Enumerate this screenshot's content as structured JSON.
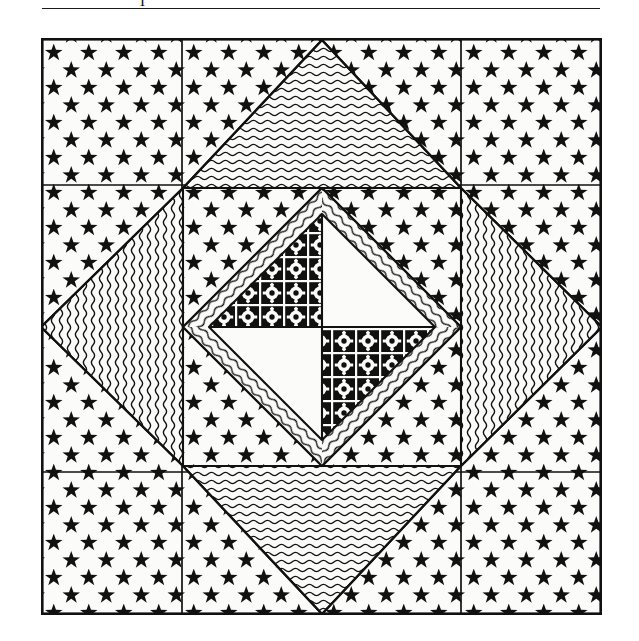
{
  "document": {
    "type": "patent-figure-scan",
    "page_background": "#ffffff",
    "ink_color": "#111111",
    "top_rule": {
      "present": true,
      "x": 42,
      "y": 8,
      "width": 558,
      "thickness": 1.6
    },
    "clipped_text_fragment": "I"
  },
  "figure": {
    "name": "star-quilt-block",
    "frame": {
      "x": 41,
      "y": 38,
      "width": 561,
      "height": 577,
      "border_thickness": 2.4
    },
    "grid_lines": {
      "vertical_x": [
        182,
        461
      ],
      "horizontal_y": [
        185,
        472
      ],
      "thickness": 1.6,
      "note": "Divides the block into a 3x3 arrangement of patches"
    },
    "center": {
      "x": 281,
      "y": 289
    },
    "star": {
      "points": 4,
      "tips": [
        {
          "label": "top",
          "x": 281,
          "y": 2
        },
        {
          "label": "right",
          "x": 561,
          "y": 289
        },
        {
          "label": "bottom",
          "x": 281,
          "y": 576
        },
        {
          "label": "left",
          "x": 0,
          "y": 289
        }
      ],
      "inner_vertices": [
        {
          "label": "top-left",
          "x": 142,
          "y": 150
        },
        {
          "label": "top-right",
          "x": 420,
          "y": 150
        },
        {
          "label": "bottom-right",
          "x": 420,
          "y": 428
        },
        {
          "label": "bottom-left",
          "x": 142,
          "y": 428
        }
      ],
      "point_fill": "horizontal-wave-hatch"
    },
    "diamond": {
      "vertices": [
        {
          "label": "top",
          "x": 281,
          "y": 150
        },
        {
          "label": "right",
          "x": 420,
          "y": 289
        },
        {
          "label": "bottom",
          "x": 281,
          "y": 428
        },
        {
          "label": "left",
          "x": 142,
          "y": 289
        }
      ],
      "band_fill": "diagonal-wave-hatch",
      "band_width": 26
    },
    "pinwheel": {
      "quadrants": [
        {
          "label": "upper-left",
          "fill": "floral-medallion",
          "shape": "triangle"
        },
        {
          "label": "upper-right",
          "fill": "plain",
          "shape": "triangle"
        },
        {
          "label": "lower-right",
          "fill": "floral-medallion",
          "shape": "triangle"
        },
        {
          "label": "lower-left",
          "fill": "plain",
          "shape": "triangle"
        }
      ]
    },
    "background": {
      "fill": "star-print",
      "star_size_px": 18,
      "star_spacing_x_px": 35,
      "star_spacing_y_px": 35,
      "star_color": "#111111",
      "ground_color": "#fbfbf9"
    },
    "patterns": {
      "star-print": "five-pointed solid stars in a staggered diamond lattice",
      "horizontal-wave-hatch": "closely spaced horizontal wavy lines",
      "diagonal-wave-hatch": "closely spaced diagonal wavy lines running parallel to the band",
      "floral-medallion": "black ground with white gridwork and white flower medallions having black centers",
      "plain": "unprinted solid light ground"
    }
  }
}
